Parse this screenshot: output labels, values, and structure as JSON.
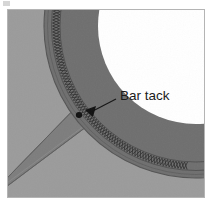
{
  "figure": {
    "alt_description": "Grayscale technical illustration of a curved webbing band with a stitched seam, a white circular opening at upper right, a diagonal strap crossing at lower left, and a callout labeling a bar tack.",
    "canvas": {
      "width": 208,
      "height": 204
    },
    "frame": {
      "name": "figure-border",
      "color": "#b4b4b4",
      "width": 1,
      "inset_left": 7,
      "inset_top": 9,
      "inset_right": 4,
      "inset_bottom": 7
    },
    "colors": {
      "background_light_gray": "#9b9b9b",
      "band_dark_gray": "#6f6f6f",
      "strap_gray": "#7d7d7d",
      "opening_white": "#ffffff",
      "stitch_dark": "#3a3a3a",
      "stitch_light": "#c8c8c8",
      "outline": "#5a5a5a",
      "callout_ink": "#1b1b1b",
      "page_white": "#ffffff"
    },
    "corner_mark": {
      "name": "scan-artifact-mark",
      "visible": true,
      "color": "#c9c9c9"
    }
  },
  "callout": {
    "label": "Bar tack",
    "label_x": 120,
    "label_y": 95,
    "leader_from_x": 116,
    "leader_from_y": 99,
    "leader_to_x": 89,
    "leader_to_y": 113,
    "arrowhead": {
      "name": "leader-arrowhead",
      "x": 86,
      "y": 110,
      "angle_deg": 208,
      "color": "#111111"
    },
    "tack_mark": {
      "name": "bar-tack-mark",
      "x": 79,
      "y": 115,
      "radius": 3.0,
      "color": "#111111"
    }
  },
  "geometry": {
    "annulus": {
      "name": "curved-webbing-band",
      "center_x": 196,
      "center_y": 26,
      "outer_radius": 152,
      "inner_radius": 98,
      "description": "Dark gray curved band (binding / webbing) sweeping from upper-left to lower-right"
    },
    "opening": {
      "name": "circular-opening",
      "center_x": 196,
      "center_y": 26,
      "radius": 98,
      "fill": "#ffffff",
      "description": "White circular cut-out at the upper right"
    },
    "stitch_seam": {
      "name": "zigzag-stitch-seam",
      "center_x": 196,
      "center_y": 26,
      "radius": 140,
      "band_width": 7,
      "pattern": "zigzag-crosshatch",
      "segments": 150
    },
    "strap": {
      "name": "diagonal-strap",
      "x1": -10,
      "y1": 206,
      "x2": 130,
      "y2": 100,
      "width": 26,
      "fill": "#7d7d7d",
      "description": "Diagonal strap running from lower-left upward to the right, passing beneath the curved band"
    }
  }
}
